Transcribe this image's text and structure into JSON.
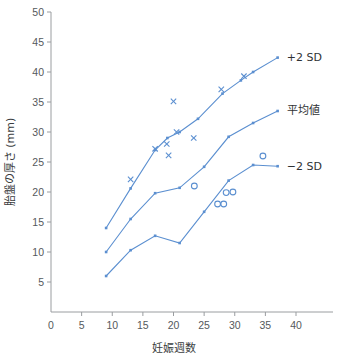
{
  "chart_data": {
    "type": "line",
    "title": "",
    "xlabel": "妊娠週数",
    "ylabel": "胎盤の厚さ (mm)",
    "xlim": [
      0,
      40
    ],
    "ylim": [
      0,
      50
    ],
    "xticks": [
      0,
      5,
      10,
      15,
      20,
      25,
      30,
      35,
      40
    ],
    "yticks": [
      5,
      10,
      15,
      20,
      25,
      30,
      35,
      40,
      45,
      50
    ],
    "grid": false,
    "legend_position": "right-inline",
    "accent_color": "#5b8fd0",
    "axis_color": "#9a9da0",
    "series": [
      {
        "name": "+2 SD",
        "marker": "small-dot",
        "x": [
          9,
          13,
          17,
          19,
          21,
          24,
          28,
          31,
          33,
          37
        ],
        "values": [
          14.0,
          20.6,
          27.0,
          29.0,
          30.0,
          32.2,
          36.4,
          38.6,
          40.0,
          42.4
        ]
      },
      {
        "name": "平均値",
        "marker": "small-dot",
        "x": [
          9,
          13,
          17,
          21,
          25,
          29,
          33,
          37
        ],
        "values": [
          10.0,
          15.5,
          19.8,
          20.7,
          24.2,
          29.2,
          31.5,
          33.5
        ]
      },
      {
        "name": "−2 SD",
        "marker": "small-dot",
        "x": [
          9,
          13,
          17,
          21,
          25,
          29,
          33,
          37
        ],
        "values": [
          6.0,
          10.3,
          12.7,
          11.5,
          16.7,
          21.9,
          24.5,
          24.3
        ]
      }
    ],
    "scatter": [
      {
        "name": "cross-points",
        "marker": "x",
        "points": [
          [
            13.0,
            22.1
          ],
          [
            17.0,
            27.2
          ],
          [
            18.9,
            28.0
          ],
          [
            19.2,
            26.1
          ],
          [
            20.0,
            35.1
          ],
          [
            20.5,
            30.0
          ],
          [
            23.3,
            29.0
          ],
          [
            27.8,
            37.1
          ],
          [
            31.5,
            39.3
          ]
        ]
      },
      {
        "name": "circle-points",
        "marker": "o",
        "points": [
          [
            23.4,
            21.0
          ],
          [
            27.2,
            18.0
          ],
          [
            28.2,
            18.0
          ],
          [
            28.6,
            19.9
          ],
          [
            29.7,
            20.0
          ],
          [
            34.6,
            26.0
          ]
        ]
      }
    ],
    "annotations": [
      {
        "label": "+2 SD",
        "x": 38.5,
        "y": 42.5
      },
      {
        "label": "平均値",
        "x": 38.5,
        "y": 33.6
      },
      {
        "label": "−2 SD",
        "x": 38.5,
        "y": 24.4
      }
    ]
  }
}
